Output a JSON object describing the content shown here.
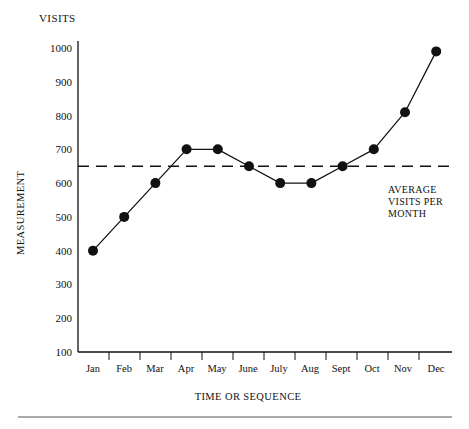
{
  "chart_data": {
    "type": "line",
    "title": "VISITS",
    "xlabel": "TIME OR SEQUENCE",
    "ylabel": "MEASUREMENT",
    "categories": [
      "Jan",
      "Feb",
      "Mar",
      "Apr",
      "May",
      "June",
      "July",
      "Aug",
      "Sept",
      "Oct",
      "Nov",
      "Dec"
    ],
    "values": [
      400,
      500,
      600,
      700,
      700,
      650,
      600,
      600,
      650,
      700,
      810,
      990
    ],
    "series": [
      {
        "name": "Visits",
        "values": [
          400,
          500,
          600,
          700,
          700,
          650,
          600,
          600,
          650,
          700,
          810,
          990
        ]
      }
    ],
    "ylim": [
      100,
      1000
    ],
    "ytick_labels": [
      "1000",
      "900",
      "800",
      "700",
      "600",
      "500",
      "400",
      "300",
      "200",
      "100"
    ],
    "ytick_values": [
      1000,
      900,
      800,
      700,
      600,
      500,
      400,
      300,
      200,
      100
    ],
    "grid": false,
    "legend_position": "none",
    "reference_line": {
      "value": 650,
      "style": "dashed",
      "label_line_1": "AVERAGE",
      "label_line_2": "VISITS PER",
      "label_line_3": "MONTH"
    },
    "marker": "filled-circle",
    "line_color": "#111111",
    "marker_color": "#111111"
  },
  "figure": {
    "chart_title": "VISITS",
    "y_axis_title": "MEASUREMENT",
    "x_axis_title": "TIME OR SEQUENCE"
  }
}
